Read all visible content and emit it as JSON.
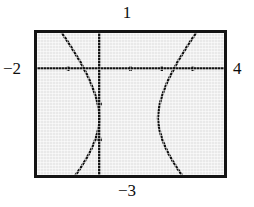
{
  "figure": {
    "kind": "graphing-calculator-screen",
    "colors": {
      "screen_background": "#e9e9e9",
      "frame": "#141414",
      "axis": "#111111",
      "curve": "#101010",
      "page_background": "#ffffff"
    }
  },
  "window_labels": {
    "ymax": "1",
    "ymin": "−3",
    "xmin": "−2",
    "xmax": "4"
  },
  "chart_data": {
    "type": "line",
    "title": "",
    "xlabel": "",
    "ylabel": "",
    "xlim": [
      -2,
      4
    ],
    "ylim": [
      -3,
      1
    ],
    "grid": false,
    "axes_shown": true,
    "x_axis_value": 0,
    "y_axis_value": 0,
    "xtick_step": 1,
    "ytick_step": 1,
    "xticks": [
      -1,
      0,
      1,
      2,
      3
    ],
    "yticks": [
      -2,
      -1,
      0
    ],
    "tick_mark_length_px": 5,
    "legend": null,
    "legend_position": "none",
    "annotations": [],
    "series": [
      {
        "name": "left-branch",
        "description": "Left hyperbola branch opening to the left, vertex near (0.1, -1.4)",
        "points": [
          [
            -1.2,
            1.0
          ],
          [
            -1.05,
            0.8
          ],
          [
            -0.9,
            0.6
          ],
          [
            -0.76,
            0.4
          ],
          [
            -0.62,
            0.2
          ],
          [
            -0.5,
            0.0
          ],
          [
            -0.38,
            -0.2
          ],
          [
            -0.28,
            -0.4
          ],
          [
            -0.19,
            -0.6
          ],
          [
            -0.11,
            -0.8
          ],
          [
            -0.05,
            -1.0
          ],
          [
            -0.01,
            -1.2
          ],
          [
            0.01,
            -1.4
          ],
          [
            -0.01,
            -1.6
          ],
          [
            -0.06,
            -1.8
          ],
          [
            -0.13,
            -2.0
          ],
          [
            -0.22,
            -2.2
          ],
          [
            -0.33,
            -2.4
          ],
          [
            -0.46,
            -2.6
          ],
          [
            -0.6,
            -2.8
          ],
          [
            -0.76,
            -3.0
          ]
        ]
      },
      {
        "name": "right-branch",
        "description": "Right hyperbola branch opening to the right, vertex near (1.85, -1.4)",
        "points": [
          [
            3.1,
            1.0
          ],
          [
            2.95,
            0.8
          ],
          [
            2.8,
            0.6
          ],
          [
            2.66,
            0.4
          ],
          [
            2.52,
            0.2
          ],
          [
            2.4,
            0.0
          ],
          [
            2.28,
            -0.2
          ],
          [
            2.17,
            -0.4
          ],
          [
            2.08,
            -0.6
          ],
          [
            2.0,
            -0.8
          ],
          [
            1.94,
            -1.0
          ],
          [
            1.9,
            -1.2
          ],
          [
            1.88,
            -1.4
          ],
          [
            1.9,
            -1.6
          ],
          [
            1.95,
            -1.8
          ],
          [
            2.02,
            -2.0
          ],
          [
            2.11,
            -2.2
          ],
          [
            2.22,
            -2.4
          ],
          [
            2.35,
            -2.6
          ],
          [
            2.49,
            -2.8
          ],
          [
            2.65,
            -3.0
          ]
        ]
      }
    ]
  }
}
